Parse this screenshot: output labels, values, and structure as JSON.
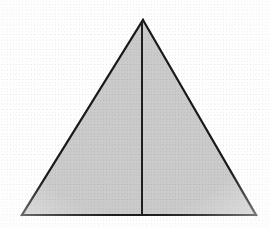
{
  "figure": {
    "background_color": "#ffffff",
    "canvas": {
      "width": 269,
      "height": 228
    },
    "shape": {
      "name": "triangle",
      "type": "isosceles-triangle",
      "fill_color": "#cbcbcb",
      "stroke_color": "#1a1a1a",
      "stroke_width": 2.2,
      "vertices": {
        "apex": {
          "label": "apex",
          "x": 143,
          "y": 20
        },
        "bottom_left": {
          "label": "bottom-left",
          "x": 22,
          "y": 215
        },
        "bottom_right": {
          "label": "bottom-right",
          "x": 256,
          "y": 215
        }
      },
      "points_path": "143,20 256,215 22,215"
    },
    "median": {
      "name": "vertical-median",
      "description": "altitude from apex to base midpoint",
      "stroke_color": "#1f1f1f",
      "stroke_width": 2.0,
      "x1": 142,
      "y1": 22,
      "x2": 142,
      "y2": 215
    },
    "measurements": {
      "base_length_px": 234,
      "height_px": 195,
      "left_half_base_px": 120,
      "right_half_base_px": 114
    },
    "labels": []
  }
}
